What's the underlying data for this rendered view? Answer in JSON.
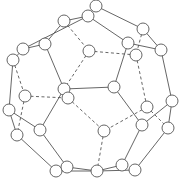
{
  "diagram": {
    "title": "",
    "type": "polyhedron-graph",
    "colors": {
      "stroke": "#555555",
      "node_fill": "#ffffff",
      "node_stroke": "#555555",
      "background": "#ffffff"
    },
    "node_radius": 6,
    "nodes": [
      {
        "id": "A",
        "x": 96,
        "y": 6
      },
      {
        "id": "B",
        "x": 88,
        "y": 16
      },
      {
        "id": "C",
        "x": 64,
        "y": 21
      },
      {
        "id": "D",
        "x": 143,
        "y": 29
      },
      {
        "id": "E",
        "x": 128,
        "y": 43
      },
      {
        "id": "F",
        "x": 161,
        "y": 50
      },
      {
        "id": "G",
        "x": 23,
        "y": 49
      },
      {
        "id": "H",
        "x": 45,
        "y": 44
      },
      {
        "id": "I",
        "x": 13,
        "y": 60
      },
      {
        "id": "J",
        "x": 89,
        "y": 51
      },
      {
        "id": "K",
        "x": 136,
        "y": 55
      },
      {
        "id": "L",
        "x": 64,
        "y": 89
      },
      {
        "id": "M",
        "x": 68,
        "y": 98
      },
      {
        "id": "N",
        "x": 114,
        "y": 87
      },
      {
        "id": "O",
        "x": 25,
        "y": 96
      },
      {
        "id": "P",
        "x": 172,
        "y": 101
      },
      {
        "id": "Q",
        "x": 147,
        "y": 107
      },
      {
        "id": "R",
        "x": 9,
        "y": 110
      },
      {
        "id": "S",
        "x": 142,
        "y": 125
      },
      {
        "id": "T",
        "x": 168,
        "y": 128
      },
      {
        "id": "U",
        "x": 40,
        "y": 130
      },
      {
        "id": "V",
        "x": 104,
        "y": 131
      },
      {
        "id": "W",
        "x": 17,
        "y": 135
      },
      {
        "id": "X",
        "x": 56,
        "y": 171
      },
      {
        "id": "Y",
        "x": 67,
        "y": 167
      },
      {
        "id": "Z",
        "x": 97,
        "y": 171
      },
      {
        "id": "AA",
        "x": 122,
        "y": 165
      },
      {
        "id": "AB",
        "x": 135,
        "y": 170
      }
    ],
    "edges": [
      {
        "from": "A",
        "to": "B",
        "style": "solid"
      },
      {
        "from": "A",
        "to": "D",
        "style": "solid"
      },
      {
        "from": "B",
        "to": "C",
        "style": "solid"
      },
      {
        "from": "B",
        "to": "E",
        "style": "solid"
      },
      {
        "from": "C",
        "to": "H",
        "style": "solid"
      },
      {
        "from": "B",
        "to": "G",
        "style": "solid"
      },
      {
        "from": "G",
        "to": "H",
        "style": "solid"
      },
      {
        "from": "G",
        "to": "I",
        "style": "solid"
      },
      {
        "from": "D",
        "to": "F",
        "style": "solid"
      },
      {
        "from": "E",
        "to": "F",
        "style": "solid"
      },
      {
        "from": "E",
        "to": "N",
        "style": "solid"
      },
      {
        "from": "H",
        "to": "L",
        "style": "solid"
      },
      {
        "from": "L",
        "to": "N",
        "style": "solid"
      },
      {
        "from": "L",
        "to": "U",
        "style": "solid"
      },
      {
        "from": "I",
        "to": "R",
        "style": "solid"
      },
      {
        "from": "R",
        "to": "U",
        "style": "solid"
      },
      {
        "from": "R",
        "to": "W",
        "style": "solid"
      },
      {
        "from": "W",
        "to": "X",
        "style": "solid"
      },
      {
        "from": "U",
        "to": "Y",
        "style": "solid"
      },
      {
        "from": "X",
        "to": "Y",
        "style": "solid"
      },
      {
        "from": "Y",
        "to": "Z",
        "style": "solid"
      },
      {
        "from": "X",
        "to": "Z",
        "style": "solid"
      },
      {
        "from": "Z",
        "to": "AA",
        "style": "solid"
      },
      {
        "from": "Z",
        "to": "AB",
        "style": "solid"
      },
      {
        "from": "AA",
        "to": "S",
        "style": "solid"
      },
      {
        "from": "AB",
        "to": "T",
        "style": "solid"
      },
      {
        "from": "N",
        "to": "S",
        "style": "solid"
      },
      {
        "from": "S",
        "to": "P",
        "style": "solid"
      },
      {
        "from": "F",
        "to": "P",
        "style": "solid"
      },
      {
        "from": "P",
        "to": "T",
        "style": "solid"
      },
      {
        "from": "C",
        "to": "J",
        "style": "dashed"
      },
      {
        "from": "J",
        "to": "K",
        "style": "dashed"
      },
      {
        "from": "J",
        "to": "L",
        "style": "dashed"
      },
      {
        "from": "D",
        "to": "K",
        "style": "dashed"
      },
      {
        "from": "K",
        "to": "Q",
        "style": "dashed"
      },
      {
        "from": "Q",
        "to": "T",
        "style": "dashed"
      },
      {
        "from": "Q",
        "to": "V",
        "style": "dashed"
      },
      {
        "from": "M",
        "to": "V",
        "style": "dashed"
      },
      {
        "from": "V",
        "to": "Z",
        "style": "dashed"
      },
      {
        "from": "O",
        "to": "M",
        "style": "dashed"
      },
      {
        "from": "I",
        "to": "O",
        "style": "dashed"
      },
      {
        "from": "O",
        "to": "W",
        "style": "dashed"
      }
    ]
  }
}
